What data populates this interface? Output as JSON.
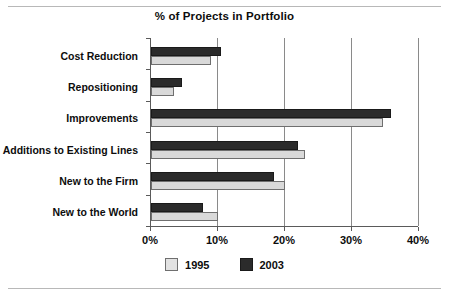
{
  "chart_data": {
    "type": "bar",
    "orientation": "horizontal",
    "title": "% of Projects in Portfolio",
    "xlabel": "",
    "ylabel": "",
    "xlim": [
      0,
      40
    ],
    "xticks": [
      "0%",
      "10%",
      "20%",
      "30%",
      "40%"
    ],
    "xtick_values": [
      0,
      10,
      20,
      30,
      40
    ],
    "grid": true,
    "legend_position": "bottom",
    "categories": [
      "Cost Reduction",
      "Repositioning",
      "Improvements",
      "Additions to Existing Lines",
      "New to the Firm",
      "New to the World"
    ],
    "series": [
      {
        "name": "1995",
        "color": "#d9d9d9",
        "values": [
          9.0,
          3.5,
          34.6,
          23.0,
          20.0,
          10.0
        ]
      },
      {
        "name": "2003",
        "color": "#2b2b2b",
        "values": [
          10.4,
          4.7,
          35.8,
          22.0,
          18.4,
          7.8
        ]
      }
    ]
  },
  "legend": {
    "items": [
      {
        "label": "1995",
        "swatch": "light-gray-swatch"
      },
      {
        "label": "2003",
        "swatch": "dark-swatch"
      }
    ]
  }
}
